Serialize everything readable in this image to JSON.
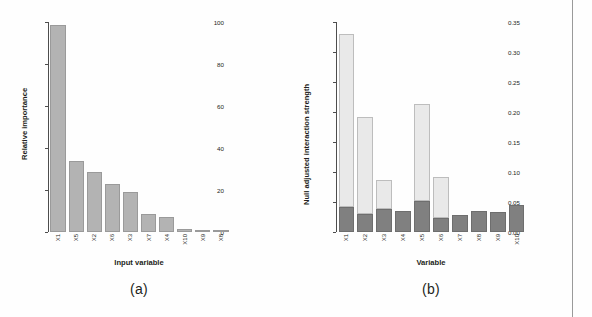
{
  "figure": {
    "panels": [
      {
        "caption": "(a)",
        "xlabel": "Input variable",
        "ylabel": "Relative importance"
      },
      {
        "caption": "(b)",
        "xlabel": "Variable",
        "ylabel": "Null adjusted interaction strength"
      }
    ]
  },
  "colors": {
    "bar_gray": "#b3b3b3",
    "bar_dark": "#808080",
    "bar_light": "#e9e9e9",
    "axis": "#4d4d4d",
    "text": "#231f20"
  },
  "chart_data": [
    {
      "type": "bar",
      "title": "(a)",
      "xlabel": "Input variable",
      "ylabel": "Relative importance",
      "categories": [
        "X1",
        "X5",
        "X2",
        "X6",
        "X3",
        "X7",
        "X4",
        "X10",
        "X9",
        "X8"
      ],
      "values": [
        98.5,
        34.0,
        28.5,
        23.0,
        19.0,
        8.8,
        7.0,
        1.5,
        1.0,
        0.4
      ],
      "ylim": [
        0,
        100
      ],
      "yticks": [
        0,
        20,
        40,
        60,
        80,
        100
      ],
      "yticklabels": [
        "0",
        "20",
        "40",
        "60",
        "80",
        "100"
      ],
      "grid": false,
      "legend": "none"
    },
    {
      "type": "bar",
      "title": "(b)",
      "xlabel": "Variable",
      "ylabel": "Null adjusted interaction strength",
      "stacked": true,
      "categories": [
        "X1",
        "X2",
        "X3",
        "X4",
        "X5",
        "X6",
        "X7",
        "X8",
        "X9",
        "X10"
      ],
      "series": [
        {
          "name": "null baseline",
          "color": "#808080",
          "values": [
            0.041,
            0.03,
            0.038,
            0.035,
            0.052,
            0.023,
            0.028,
            0.035,
            0.034,
            0.045
          ]
        },
        {
          "name": "adjusted interaction",
          "color": "#e9e9e9",
          "values": [
            0.289,
            0.162,
            0.048,
            0.0,
            0.161,
            0.069,
            0.0,
            0.0,
            0.0,
            0.0
          ]
        }
      ],
      "totals": [
        0.33,
        0.192,
        0.086,
        0.035,
        0.213,
        0.092,
        0.028,
        0.035,
        0.034,
        0.045
      ],
      "ylim": [
        0,
        0.35
      ],
      "yticks": [
        0.0,
        0.05,
        0.1,
        0.15,
        0.2,
        0.25,
        0.3,
        0.35
      ],
      "yticklabels": [
        "0.00",
        "0.05",
        "0.10",
        "0.15",
        "0.20",
        "0.25",
        "0.30",
        "0.35"
      ],
      "grid": false,
      "legend": "none"
    }
  ]
}
